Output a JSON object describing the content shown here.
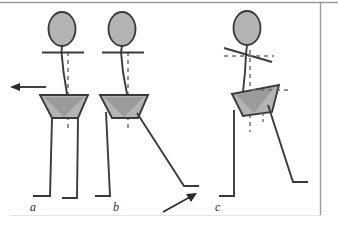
{
  "figure": {
    "panel_labels": [
      "a",
      "b",
      "c"
    ],
    "background_color": "#ffffff",
    "border_color": "#9a9a9a",
    "stroke_color": "#3a3a3a",
    "fill_gray": "#b4b4b4",
    "fill_gray_dark": "#9b9b9b",
    "dash_color": "#6f6f6f"
  },
  "panels": [
    {
      "id": "a",
      "label": "a",
      "description": "Upright stance with vertical trunk, level shoulder bar, pelvis trapezoid, both legs vertical",
      "arrow": {
        "name": "motion-arrow-left",
        "direction": "left"
      },
      "parts": [
        "head",
        "trunk",
        "shoulder-bar",
        "pelvis-trapezoid",
        "pelvis-inner-triangle",
        "left-leg",
        "right-leg",
        "vertical-dashed-reference"
      ]
    },
    {
      "id": "b",
      "label": "b",
      "description": "Mid-swing with trailing leg extended backward to the right, trunk slightly inclined",
      "arrow": {
        "name": "motion-arrow-up-right",
        "direction": "up-right"
      },
      "parts": [
        "head",
        "trunk",
        "shoulder-bar",
        "pelvis-trapezoid",
        "pelvis-inner-triangle",
        "stance-leg",
        "swing-leg",
        "vertical-dashed-reference"
      ]
    },
    {
      "id": "c",
      "label": "c",
      "description": "Trunk and pelvis rotated; shoulder bar tilted across a horizontal dashed reference; pelvis trapezoid rotated; trailing leg extended backward to the right",
      "arrow": null,
      "parts": [
        "head",
        "trunk",
        "tilted-shoulder-bar",
        "horizontal-dashed-shoulder-reference",
        "pelvis-trapezoid-rotated",
        "horizontal-dashed-pelvis-reference",
        "stance-leg",
        "swing-leg",
        "vertical-dashed-reference"
      ]
    }
  ]
}
